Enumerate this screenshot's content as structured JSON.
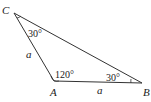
{
  "diagram": {
    "type": "triangle",
    "vertices": {
      "C": {
        "label": "C",
        "x": 14,
        "y": 13
      },
      "A": {
        "label": "A",
        "x": 54,
        "y": 81
      },
      "B": {
        "label": "B",
        "x": 142,
        "y": 83
      }
    },
    "sides": {
      "CA": {
        "label": "a"
      },
      "AB": {
        "label": "a"
      }
    },
    "angles": {
      "C": {
        "label": "30°"
      },
      "A": {
        "label": "120°"
      },
      "B": {
        "label": "30°"
      }
    },
    "stroke_color": "#333333"
  }
}
